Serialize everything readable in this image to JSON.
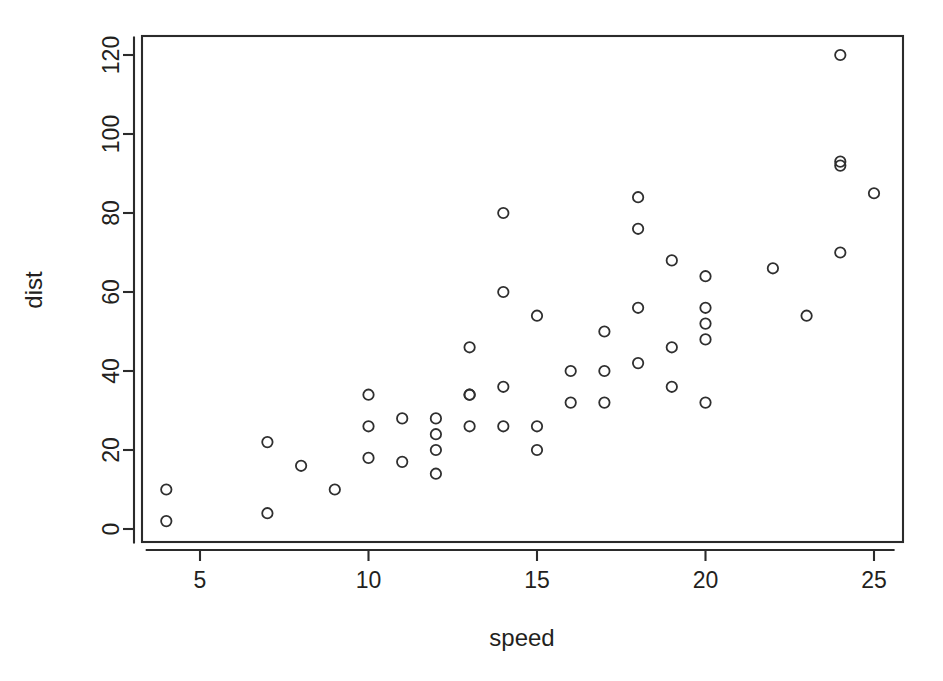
{
  "chart_data": {
    "type": "scatter",
    "title": "",
    "subtitle": "",
    "xlabel": "speed",
    "ylabel": "dist",
    "grid": false,
    "legend": "none",
    "xlim": [
      3.42,
      25.58
    ],
    "ylim": [
      -3.4,
      124.4
    ],
    "xticks": [
      5,
      10,
      15,
      20,
      25
    ],
    "yticks": [
      0,
      20,
      40,
      60,
      80,
      100,
      120
    ],
    "xtick_labels": [
      "5",
      "10",
      "15",
      "20",
      "25"
    ],
    "ytick_labels": [
      "0",
      "20",
      "40",
      "60",
      "80",
      "100",
      "120"
    ],
    "marker": "open-circle",
    "marker_color": "#2f2f2f",
    "n_points": 50,
    "x": [
      4,
      4,
      7,
      7,
      8,
      9,
      10,
      10,
      10,
      11,
      11,
      12,
      12,
      12,
      12,
      13,
      13,
      13,
      13,
      14,
      14,
      14,
      14,
      15,
      15,
      15,
      16,
      16,
      17,
      17,
      17,
      18,
      18,
      18,
      18,
      19,
      19,
      19,
      20,
      20,
      20,
      20,
      20,
      22,
      23,
      24,
      24,
      24,
      24,
      25
    ],
    "y": [
      2,
      10,
      4,
      22,
      16,
      10,
      18,
      26,
      34,
      17,
      28,
      14,
      20,
      24,
      28,
      26,
      34,
      34,
      46,
      26,
      36,
      60,
      80,
      20,
      26,
      54,
      32,
      40,
      32,
      40,
      50,
      42,
      56,
      76,
      84,
      36,
      46,
      68,
      32,
      48,
      52,
      56,
      64,
      66,
      54,
      70,
      92,
      93,
      120,
      85
    ],
    "points": [
      {
        "speed": 4,
        "dist": 2
      },
      {
        "speed": 4,
        "dist": 10
      },
      {
        "speed": 7,
        "dist": 4
      },
      {
        "speed": 7,
        "dist": 22
      },
      {
        "speed": 8,
        "dist": 16
      },
      {
        "speed": 9,
        "dist": 10
      },
      {
        "speed": 10,
        "dist": 18
      },
      {
        "speed": 10,
        "dist": 26
      },
      {
        "speed": 10,
        "dist": 34
      },
      {
        "speed": 11,
        "dist": 17
      },
      {
        "speed": 11,
        "dist": 28
      },
      {
        "speed": 12,
        "dist": 14
      },
      {
        "speed": 12,
        "dist": 20
      },
      {
        "speed": 12,
        "dist": 24
      },
      {
        "speed": 12,
        "dist": 28
      },
      {
        "speed": 13,
        "dist": 26
      },
      {
        "speed": 13,
        "dist": 34
      },
      {
        "speed": 13,
        "dist": 34
      },
      {
        "speed": 13,
        "dist": 46
      },
      {
        "speed": 14,
        "dist": 26
      },
      {
        "speed": 14,
        "dist": 36
      },
      {
        "speed": 14,
        "dist": 60
      },
      {
        "speed": 14,
        "dist": 80
      },
      {
        "speed": 15,
        "dist": 20
      },
      {
        "speed": 15,
        "dist": 26
      },
      {
        "speed": 15,
        "dist": 54
      },
      {
        "speed": 16,
        "dist": 32
      },
      {
        "speed": 16,
        "dist": 40
      },
      {
        "speed": 17,
        "dist": 32
      },
      {
        "speed": 17,
        "dist": 40
      },
      {
        "speed": 17,
        "dist": 50
      },
      {
        "speed": 18,
        "dist": 42
      },
      {
        "speed": 18,
        "dist": 56
      },
      {
        "speed": 18,
        "dist": 76
      },
      {
        "speed": 18,
        "dist": 84
      },
      {
        "speed": 19,
        "dist": 36
      },
      {
        "speed": 19,
        "dist": 46
      },
      {
        "speed": 19,
        "dist": 68
      },
      {
        "speed": 20,
        "dist": 32
      },
      {
        "speed": 20,
        "dist": 48
      },
      {
        "speed": 20,
        "dist": 52
      },
      {
        "speed": 20,
        "dist": 56
      },
      {
        "speed": 20,
        "dist": 64
      },
      {
        "speed": 22,
        "dist": 66
      },
      {
        "speed": 23,
        "dist": 54
      },
      {
        "speed": 24,
        "dist": 70
      },
      {
        "speed": 24,
        "dist": 92
      },
      {
        "speed": 24,
        "dist": 93
      },
      {
        "speed": 24,
        "dist": 120
      },
      {
        "speed": 25,
        "dist": 85
      }
    ]
  },
  "geometry": {
    "canvas_width": 943,
    "canvas_height": 681,
    "plot_left": 142,
    "plot_right": 903,
    "plot_top": 36,
    "plot_bottom": 542,
    "x_pixel_at_5": 200,
    "x_pixel_per_unit": 33.7,
    "y_pixel_at_0": 529,
    "y_pixel_per_unit": 3.95,
    "marker_radius": 5.2,
    "tick_length": 11
  }
}
